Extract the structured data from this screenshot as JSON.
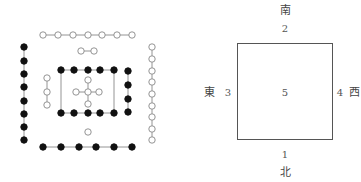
{
  "hetu": {
    "style": {
      "line_color": "#888888",
      "dark_fill": "#111111",
      "light_fill": "#ffffff",
      "light_stroke": "#888888",
      "radius": 3.2
    },
    "groups": [
      {
        "name": "top-row-7-open",
        "type": "open",
        "connected": true,
        "points": [
          [
            43,
            35
          ],
          [
            58,
            35
          ],
          [
            73,
            35
          ],
          [
            88,
            35
          ],
          [
            102,
            35
          ],
          [
            117,
            35
          ],
          [
            132,
            35
          ]
        ]
      },
      {
        "name": "pair-2-open",
        "type": "open",
        "connected": true,
        "points": [
          [
            81,
            51
          ],
          [
            94,
            51
          ]
        ]
      },
      {
        "name": "left-col-8-dark",
        "type": "dark",
        "connected": true,
        "points": [
          [
            24,
            47
          ],
          [
            24,
            61
          ],
          [
            24,
            74
          ],
          [
            24,
            87
          ],
          [
            24,
            101
          ],
          [
            24,
            114
          ],
          [
            24,
            127
          ],
          [
            24,
            140
          ]
        ]
      },
      {
        "name": "right-col-9-open",
        "type": "open",
        "connected": true,
        "points": [
          [
            152,
            47
          ],
          [
            152,
            59
          ],
          [
            152,
            71
          ],
          [
            152,
            82
          ],
          [
            152,
            94
          ],
          [
            152,
            106
          ],
          [
            152,
            117
          ],
          [
            152,
            129
          ],
          [
            152,
            140
          ]
        ]
      },
      {
        "name": "bottom-row-6-dark",
        "type": "dark",
        "connected": true,
        "points": [
          [
            43,
            147
          ],
          [
            61,
            147
          ],
          [
            79,
            147
          ],
          [
            96,
            147
          ],
          [
            114,
            147
          ],
          [
            132,
            147
          ]
        ]
      },
      {
        "name": "inner-top-5-dark",
        "type": "dark",
        "connected": true,
        "points": [
          [
            61,
            70
          ],
          [
            74,
            70
          ],
          [
            88,
            70
          ],
          [
            100,
            70
          ],
          [
            114,
            70
          ]
        ]
      },
      {
        "name": "inner-bottom-5-dark",
        "type": "dark",
        "connected": true,
        "points": [
          [
            61,
            113
          ],
          [
            74,
            113
          ],
          [
            88,
            113
          ],
          [
            100,
            113
          ],
          [
            114,
            113
          ]
        ]
      },
      {
        "name": "inner-left-3-open",
        "type": "open",
        "connected": true,
        "points": [
          [
            47,
            78
          ],
          [
            47,
            92
          ],
          [
            47,
            105
          ]
        ]
      },
      {
        "name": "inner-right-4-dark",
        "type": "dark",
        "connected": true,
        "points": [
          [
            128,
            71
          ],
          [
            128,
            85
          ],
          [
            128,
            99
          ],
          [
            128,
            112
          ]
        ]
      },
      {
        "name": "single-1-open",
        "type": "open",
        "connected": false,
        "points": [
          [
            88,
            132
          ]
        ]
      }
    ],
    "inner_frame_lines": [
      [
        61,
        70,
        61,
        113
      ],
      [
        114,
        70,
        114,
        113
      ]
    ],
    "center_cross": {
      "center": [
        88,
        92
      ],
      "arms": [
        [
          76,
          92
        ],
        [
          99,
          92
        ],
        [
          88,
          80
        ],
        [
          88,
          104
        ]
      ],
      "type": "open"
    }
  },
  "square_diagram": {
    "square": {
      "left": 237,
      "top": 43,
      "width": 96,
      "height": 97
    },
    "labels": {
      "south": {
        "text": "南",
        "x": 285,
        "y": 11
      },
      "two": {
        "text": "2",
        "x": 285,
        "y": 29
      },
      "east": {
        "text": "東",
        "x": 209,
        "y": 93
      },
      "three": {
        "text": "3",
        "x": 228,
        "y": 93
      },
      "five": {
        "text": "5",
        "x": 285,
        "y": 93
      },
      "four": {
        "text": "4",
        "x": 340,
        "y": 93
      },
      "west": {
        "text": "西",
        "x": 354,
        "y": 93
      },
      "one": {
        "text": "1",
        "x": 285,
        "y": 155
      },
      "north": {
        "text": "北",
        "x": 285,
        "y": 173
      }
    }
  }
}
